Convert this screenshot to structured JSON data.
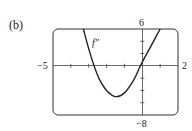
{
  "panel_label": "(b)",
  "chart_data": {
    "type": "line",
    "title": "",
    "xlabel": "",
    "ylabel": "",
    "xlim": [
      -5,
      2
    ],
    "ylim": [
      -8,
      6
    ],
    "x_tick_labels": {
      "left": "−5",
      "right": "2"
    },
    "y_tick_labels": {
      "top": "6",
      "bottom": "−8"
    },
    "grid": false,
    "series": [
      {
        "name": "f″",
        "label": "f″",
        "x": [
          -3.3,
          -3.0,
          -2.7,
          -2.4,
          -2.0,
          -1.5,
          -1.0,
          -0.5,
          -0.2,
          0.0,
          0.5,
          1.0
        ],
        "y": [
          6.0,
          2.8,
          0.0,
          -2.2,
          -4.0,
          -5.0,
          -4.4,
          -2.4,
          -0.6,
          0.6,
          3.3,
          6.0
        ]
      }
    ]
  }
}
